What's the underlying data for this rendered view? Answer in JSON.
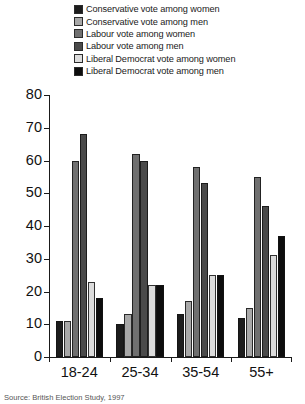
{
  "chart_data": {
    "type": "bar",
    "title": "",
    "subtitle": "",
    "xlabel": "",
    "ylabel": "",
    "ylim": [
      0,
      80
    ],
    "yticks": [
      0,
      10,
      20,
      30,
      40,
      50,
      60,
      70,
      80
    ],
    "grid": false,
    "legend_position": "top",
    "categories": [
      "18-24",
      "25-34",
      "35-54",
      "55+"
    ],
    "series": [
      {
        "name": "Conservative vote among women",
        "color": "#1c1c1c",
        "values": [
          11,
          10,
          13,
          12
        ]
      },
      {
        "name": "Conservative vote among men",
        "color": "#a8a8a8",
        "values": [
          11,
          13,
          17,
          15
        ]
      },
      {
        "name": "Labour vote among women",
        "color": "#707070",
        "values": [
          60,
          62,
          58,
          55
        ]
      },
      {
        "name": "Labour vote among men",
        "color": "#4a4a4a",
        "values": [
          68,
          60,
          53,
          46
        ]
      },
      {
        "name": "Liberal Democrat vote among women",
        "color": "#dcdcdc",
        "values": [
          23,
          22,
          25,
          31
        ]
      },
      {
        "name": "Liberal Democrat vote among men",
        "color": "#0d0d0d",
        "values": [
          18,
          22,
          25,
          37
        ]
      }
    ],
    "footnote": "Source: British Election Study, 1997"
  }
}
